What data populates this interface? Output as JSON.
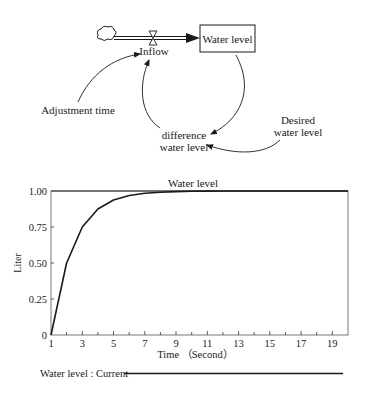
{
  "diagram": {
    "stock": {
      "label": "Water level"
    },
    "flow": {
      "label": "Inflow"
    },
    "variables": {
      "adjustment_time": "Adjustment time",
      "difference_line1": "difference",
      "difference_line2": "water level",
      "desired_line1": "Desired",
      "desired_line2": "water level"
    }
  },
  "chart": {
    "title": "Water level",
    "ylabel": "Liter",
    "xlabel": "Time （Second）",
    "yticks": [
      "1.00",
      "0.75",
      "0.50",
      "0.25",
      "0"
    ],
    "xticks": [
      "1",
      "3",
      "5",
      "7",
      "9",
      "11",
      "13",
      "15",
      "17",
      "19"
    ],
    "legend": "Water level : Current"
  },
  "chart_data": {
    "type": "line",
    "title": "Water level",
    "xlabel": "Time （Second）",
    "ylabel": "Liter",
    "xlim": [
      1,
      20
    ],
    "ylim": [
      0,
      1
    ],
    "grid": false,
    "legend_position": "bottom",
    "x": [
      1,
      2,
      3,
      4,
      5,
      6,
      7,
      8,
      9,
      10,
      11,
      12,
      13,
      14,
      15,
      16,
      17,
      18,
      19,
      20
    ],
    "series": [
      {
        "name": "Water level : Current",
        "values": [
          0,
          0.5,
          0.75,
          0.875,
          0.9375,
          0.969,
          0.984,
          0.992,
          0.996,
          0.998,
          0.999,
          1,
          1,
          1,
          1,
          1,
          1,
          1,
          1,
          1
        ]
      }
    ]
  }
}
